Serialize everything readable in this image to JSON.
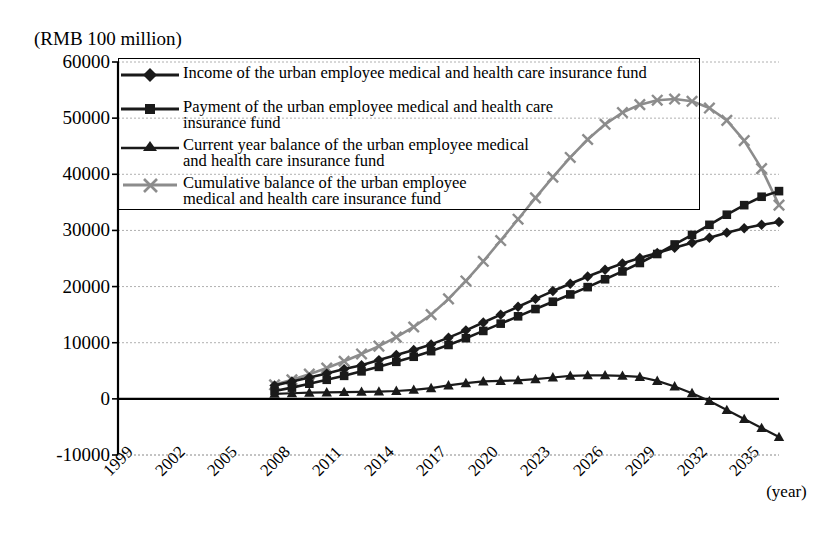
{
  "chart_data": {
    "type": "line",
    "title": "",
    "ylabel": "(RMB 100 million)",
    "xlabel": "(year)",
    "ylim": [
      -10000,
      60000
    ],
    "ytick_labels": [
      "60000",
      "50000",
      "40000",
      "30000",
      "20000",
      "10000",
      "0",
      "-10000"
    ],
    "ytick_values": [
      60000,
      50000,
      40000,
      30000,
      20000,
      10000,
      0,
      -10000
    ],
    "xtick_labels": [
      "1999",
      "2002",
      "2005",
      "2008",
      "2011",
      "2014",
      "2017",
      "2020",
      "2023",
      "2026",
      "2029",
      "2032",
      "2035"
    ],
    "xtick_values": [
      1999,
      2002,
      2005,
      2008,
      2011,
      2014,
      2017,
      2020,
      2023,
      2026,
      2029,
      2032,
      2035
    ],
    "xlim": [
      1999,
      2037
    ],
    "grid": true,
    "legend_position": "top-left-inside",
    "x": [
      2008,
      2009,
      2010,
      2011,
      2012,
      2013,
      2014,
      2015,
      2016,
      2017,
      2018,
      2019,
      2020,
      2021,
      2022,
      2023,
      2024,
      2025,
      2026,
      2027,
      2028,
      2029,
      2030,
      2031,
      2032,
      2033,
      2034,
      2035,
      2036,
      2037
    ],
    "series": [
      {
        "name": "Income of the urban employee medical and health care insurance fund",
        "marker": "diamond",
        "color": "#1a1a1a",
        "values": [
          2400,
          3100,
          3800,
          4500,
          5300,
          6000,
          6900,
          7800,
          8700,
          9700,
          10900,
          12200,
          13600,
          15000,
          16400,
          17800,
          19200,
          20500,
          21800,
          23000,
          24100,
          25100,
          26000,
          26900,
          27800,
          28700,
          29600,
          30400,
          31000,
          31500
        ]
      },
      {
        "name": "Payment of the urban employee medical and health care insurance fund",
        "marker": "square",
        "color": "#1a1a1a",
        "values": [
          1400,
          2000,
          2700,
          3400,
          4100,
          4900,
          5700,
          6600,
          7500,
          8500,
          9600,
          10800,
          12100,
          13400,
          14700,
          16000,
          17300,
          18600,
          19900,
          21300,
          22700,
          24200,
          25800,
          27500,
          29200,
          31000,
          32800,
          34500,
          36000,
          37000
        ]
      },
      {
        "name": "Current year balance of the urban employee medical and health care insurance fund",
        "marker": "triangle",
        "color": "#1a1a1a",
        "values": [
          900,
          1000,
          1100,
          1150,
          1200,
          1250,
          1300,
          1400,
          1600,
          1900,
          2400,
          2800,
          3100,
          3200,
          3300,
          3500,
          3800,
          4100,
          4200,
          4200,
          4100,
          3900,
          3200,
          2200,
          1000,
          -400,
          -2000,
          -3600,
          -5200,
          -6800
        ]
      },
      {
        "name": "Cumulative balance of the urban employee medical and health care insurance fund",
        "marker": "x",
        "color": "#8c8c8c",
        "values": [
          2500,
          3400,
          4400,
          5500,
          6700,
          8000,
          9400,
          11000,
          12800,
          15000,
          17800,
          21000,
          24500,
          28200,
          32000,
          35800,
          39500,
          43000,
          46200,
          48900,
          51000,
          52400,
          53200,
          53400,
          53000,
          51800,
          49600,
          46000,
          41000,
          34500
        ]
      }
    ]
  },
  "axis": {
    "unit_label": "(RMB 100 million)",
    "year_label": "(year)"
  },
  "legend": {
    "items": [
      {
        "label": "Income of the urban employee medical and health care insurance fund",
        "marker": "diamond-marker-icon"
      },
      {
        "label": "Payment of the urban employee medical and health care\ninsurance fund",
        "marker": "square-marker-icon"
      },
      {
        "label": "Current year balance of the urban employee medical\nand health care insurance fund",
        "marker": "triangle-marker-icon"
      },
      {
        "label": "Cumulative balance of the urban employee\nmedical and health care insurance fund",
        "marker": "x-marker-icon"
      }
    ]
  },
  "colors": {
    "series_dark": "#1a1a1a",
    "series_gray": "#8c8c8c",
    "axis": "#000000",
    "grid": "#b0b0b0"
  }
}
